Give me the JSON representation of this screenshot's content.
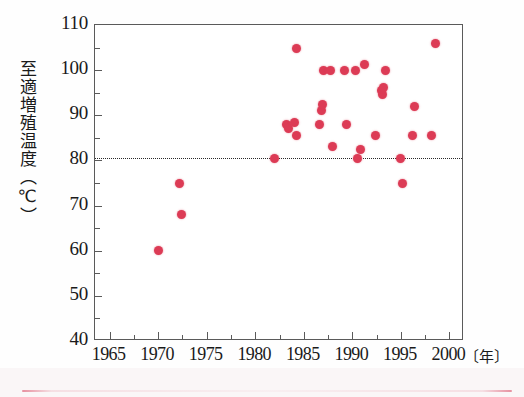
{
  "chart": {
    "type": "scatter",
    "title": "",
    "subtitle": "",
    "y_axis_title": "至適増殖温度（℃）",
    "x_axis_unit": "〔年〕",
    "x_axis_title": "",
    "point_color": "#dc3b55",
    "axis_color": "#5a5a5a",
    "threshold_line_color": "#2a2a2a",
    "threshold_line_style": "dotted",
    "threshold_value": 80.5,
    "grid": "off",
    "legend": "none",
    "xlim": [
      1963.5,
      2001.5
    ],
    "ylim": [
      40,
      110
    ],
    "y_ticks_major": [
      40,
      50,
      60,
      70,
      80,
      90,
      100,
      110
    ],
    "y_ticks_minor": [
      45,
      55,
      65,
      75,
      85,
      95,
      105
    ],
    "x_ticks_major": [
      1965,
      1970,
      1975,
      1980,
      1985,
      1990,
      1995,
      2000
    ],
    "x_ticks_minor": [
      1967.5,
      1972.5,
      1977.5,
      1982.5,
      1987.5,
      1992.5,
      1997.5
    ],
    "y_tick_labels": [
      "110",
      "100",
      "90",
      "80",
      "70",
      "60",
      "50",
      "40"
    ],
    "x_tick_labels": [
      "1965",
      "1970",
      "1975",
      "1980",
      "1985",
      "1990",
      "1995",
      "2000"
    ]
  },
  "chart_data": {
    "type": "scatter",
    "xlabel": "年",
    "ylabel": "至適増殖温度（℃）",
    "xlim": [
      1963.5,
      2001.5
    ],
    "ylim": [
      40,
      110
    ],
    "xticks": [
      1965,
      1970,
      1975,
      1980,
      1985,
      1990,
      1995,
      2000
    ],
    "yticks": [
      40,
      50,
      60,
      70,
      80,
      90,
      100,
      110
    ],
    "grid": false,
    "legend_position": "none",
    "annotations": [
      {
        "type": "hline",
        "y": 80.5,
        "style": "dotted",
        "color": "#2a2a2a",
        "label": ""
      }
    ],
    "series": [
      {
        "name": "至適増殖温度",
        "marker": "circle",
        "color": "#dc3b55",
        "points": [
          {
            "x": 1970.0,
            "y": 60.0
          },
          {
            "x": 1972.2,
            "y": 75.0
          },
          {
            "x": 1972.4,
            "y": 68.0
          },
          {
            "x": 1982.0,
            "y": 80.5
          },
          {
            "x": 1983.2,
            "y": 88.0
          },
          {
            "x": 1983.4,
            "y": 87.0
          },
          {
            "x": 1984.0,
            "y": 88.5
          },
          {
            "x": 1984.2,
            "y": 85.5
          },
          {
            "x": 1984.3,
            "y": 104.8
          },
          {
            "x": 1986.6,
            "y": 88.0
          },
          {
            "x": 1986.8,
            "y": 91.0
          },
          {
            "x": 1986.9,
            "y": 92.5
          },
          {
            "x": 1987.0,
            "y": 100.0
          },
          {
            "x": 1987.8,
            "y": 100.0
          },
          {
            "x": 1988.0,
            "y": 83.0
          },
          {
            "x": 1989.2,
            "y": 100.0
          },
          {
            "x": 1989.4,
            "y": 88.0
          },
          {
            "x": 1990.3,
            "y": 100.0
          },
          {
            "x": 1990.5,
            "y": 80.5
          },
          {
            "x": 1990.8,
            "y": 82.5
          },
          {
            "x": 1991.3,
            "y": 101.3
          },
          {
            "x": 1992.4,
            "y": 85.5
          },
          {
            "x": 1993.0,
            "y": 95.5
          },
          {
            "x": 1993.1,
            "y": 94.5
          },
          {
            "x": 1993.2,
            "y": 96.2
          },
          {
            "x": 1993.4,
            "y": 100.0
          },
          {
            "x": 1995.0,
            "y": 80.5
          },
          {
            "x": 1995.2,
            "y": 75.0
          },
          {
            "x": 1996.2,
            "y": 85.5
          },
          {
            "x": 1996.4,
            "y": 92.0
          },
          {
            "x": 1998.2,
            "y": 85.5
          },
          {
            "x": 1998.6,
            "y": 106.0
          }
        ]
      }
    ]
  }
}
